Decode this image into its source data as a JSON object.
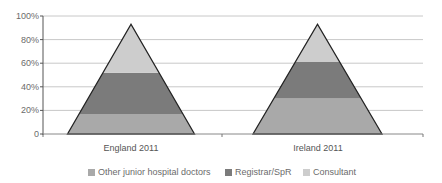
{
  "chart_data": {
    "type": "area",
    "subtype": "stacked-pyramid",
    "title": "",
    "xlabel": "",
    "ylabel": "",
    "ylim": [
      0,
      100
    ],
    "yticks": [
      "0",
      "20%",
      "40%",
      "60%",
      "80%",
      "100%"
    ],
    "grid": true,
    "legend_position": "bottom",
    "categories": [
      "England 2011",
      "Ireland 2011"
    ],
    "apex_percent": [
      93,
      93
    ],
    "series": [
      {
        "name": "Other junior hospital doctors",
        "color": "#a9a9a9",
        "values": [
          17,
          30
        ]
      },
      {
        "name": "Registrar/SpR",
        "color": "#7b7b7b",
        "values": [
          35,
          31
        ]
      },
      {
        "name": "Consultant",
        "color": "#cdcdcd",
        "values": [
          41,
          32
        ]
      }
    ],
    "band_boundaries_percent": {
      "England 2011": [
        0,
        17,
        52,
        93
      ],
      "Ireland 2011": [
        0,
        30,
        61,
        93
      ]
    }
  },
  "axis": {
    "y_ticks": [
      {
        "label": "100%",
        "value": 100
      },
      {
        "label": "80%",
        "value": 80
      },
      {
        "label": "60%",
        "value": 60
      },
      {
        "label": "40%",
        "value": 40
      },
      {
        "label": "20%",
        "value": 20
      },
      {
        "label": "0",
        "value": 0
      }
    ]
  },
  "categories": [
    {
      "label": "England 2011"
    },
    {
      "label": "Ireland 2011"
    }
  ],
  "legend": [
    {
      "label": "Other junior hospital doctors",
      "color": "#a9a9a9"
    },
    {
      "label": "Registrar/SpR",
      "color": "#7b7b7b"
    },
    {
      "label": "Consultant",
      "color": "#cdcdcd"
    }
  ]
}
